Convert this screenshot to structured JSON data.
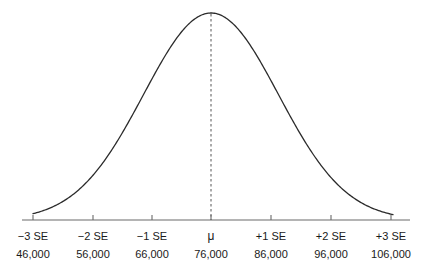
{
  "chart_data": {
    "type": "line",
    "title": "",
    "subtitle": "",
    "xlabel": "",
    "ylabel": "",
    "grid": false,
    "legend": false,
    "curve": {
      "name": "normal-sampling-distribution",
      "distribution": "normal",
      "mean_label": "μ",
      "mean_value": 76000,
      "standard_error": 10000,
      "peak_x_units": 0,
      "color": "#2b2b2b",
      "line_width": 1.3
    },
    "mean_line": {
      "style": "dashed",
      "color": "#555555",
      "x_units": 0
    },
    "axis": {
      "orientation": "horizontal",
      "color": "#6a6a6a",
      "xlim_units": [
        -3.4,
        3.4
      ],
      "tick_direction": "up"
    },
    "x": [
      -3,
      -2,
      -1,
      0,
      1,
      2,
      3
    ],
    "categories": [
      "−3 SE",
      "−2 SE",
      "−1 SE",
      "μ",
      "+1 SE",
      "+2 SE",
      "+3 SE"
    ],
    "values": [
      46000,
      56000,
      66000,
      76000,
      86000,
      96000,
      106000
    ],
    "ticks": [
      {
        "se_label": "−3 SE",
        "value_label": "46,000",
        "x_units": -3
      },
      {
        "se_label": "−2 SE",
        "value_label": "56,000",
        "x_units": -2
      },
      {
        "se_label": "−1 SE",
        "value_label": "66,000",
        "x_units": -1
      },
      {
        "se_label": "μ",
        "value_label": "76,000",
        "x_units": 0
      },
      {
        "se_label": "+1 SE",
        "value_label": "86,000",
        "x_units": 1
      },
      {
        "se_label": "+2 SE",
        "value_label": "96,000",
        "x_units": 2
      },
      {
        "se_label": "+3 SE",
        "value_label": "106,000",
        "x_units": 3
      }
    ]
  },
  "geometry": {
    "tick_pixel_positions": [
      33,
      93,
      152,
      211,
      271,
      331,
      391
    ],
    "baseline_y": 220,
    "peak_y": 13,
    "axis_x_start": 22,
    "axis_x_end": 410
  }
}
